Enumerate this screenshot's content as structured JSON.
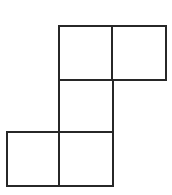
{
  "figure": {
    "background_color": "#ffffff",
    "stroke_color": "#272727",
    "fill_color": "#ffffff",
    "stroke_width": 2.6,
    "canvas_width": 172,
    "canvas_height": 195,
    "cell_size": 54,
    "square_count": 5,
    "grid": {
      "columns": 3,
      "rows": 3,
      "column_x": [
        7,
        59,
        112
      ],
      "row_y": [
        26,
        80,
        132
      ]
    },
    "squares": [
      {
        "id": "square-top-left",
        "name": "top-left square",
        "col": 1,
        "row": 0,
        "x": 59,
        "y": 26,
        "w": 54,
        "h": 54
      },
      {
        "id": "square-top-right",
        "name": "top-right square",
        "col": 2,
        "row": 0,
        "x": 112,
        "y": 26,
        "w": 54,
        "h": 54
      },
      {
        "id": "square-middle",
        "name": "middle connector square",
        "col": 1,
        "row": 1,
        "x": 59,
        "y": 80,
        "w": 54,
        "h": 52
      },
      {
        "id": "square-bottom-left",
        "name": "bottom-left square",
        "col": 0,
        "row": 2,
        "x": 7,
        "y": 132,
        "w": 54,
        "h": 54
      },
      {
        "id": "square-bottom-right",
        "name": "bottom-middle square",
        "col": 1,
        "row": 2,
        "x": 59,
        "y": 132,
        "w": 54,
        "h": 54
      }
    ]
  }
}
